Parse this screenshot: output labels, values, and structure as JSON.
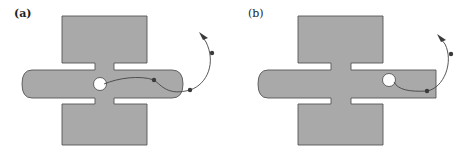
{
  "panels": [
    {
      "id": "a",
      "label": "(a)",
      "description": "Cross-shaped cavity; horizontal channel rounded at both ends; particle trajectory leaves hole and exits past right end",
      "trajectory_points": 3
    },
    {
      "id": "b",
      "label": "(b)",
      "description": "Cross-shaped cavity; horizontal channel rounded at left end, square at right end; hole near right end; particle trajectory exits right",
      "trajectory_points": 2
    }
  ],
  "colors": {
    "shape_fill": "#a9a9a9",
    "shape_stroke": "#555555",
    "trajectory": "#444444",
    "background": "#ffffff"
  }
}
